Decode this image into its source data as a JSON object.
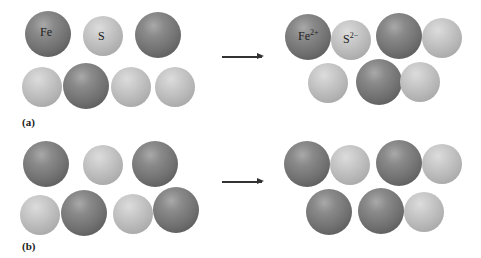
{
  "figure": {
    "panels": [
      {
        "label": "(a)",
        "before": {
          "labels": {
            "fe": "Fe",
            "s": "S"
          }
        },
        "after": {
          "labels": {
            "fe": "Fe",
            "fe_charge": "2+",
            "s": "S",
            "s_charge": "2−"
          }
        }
      },
      {
        "label": "(b)"
      }
    ],
    "colors": {
      "fe_atom": "#707070",
      "s_atom": "#bdbdbd",
      "arrow": "#333333"
    }
  }
}
